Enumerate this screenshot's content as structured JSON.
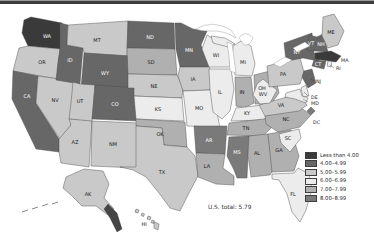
{
  "figure": {
    "us_total": "U.S. total: 5.79"
  },
  "legend": {
    "items": [
      {
        "key": "c1",
        "label": "Less than 4.00",
        "color": "#3a3a3a"
      },
      {
        "key": "c2",
        "label": "4.00–4.99",
        "color": "#676767"
      },
      {
        "key": "c3",
        "label": "5.00–5.99",
        "color": "#c9c9c9"
      },
      {
        "key": "c4",
        "label": "6.00–6.99",
        "color": "#ececec"
      },
      {
        "key": "c5",
        "label": "7.00–7.99",
        "color": "#b0b0b0"
      },
      {
        "key": "c6",
        "label": "8.00–8.99",
        "color": "#7a7a7a"
      }
    ]
  },
  "map": {
    "states": [
      {
        "abbr": "WA",
        "category": "c1"
      },
      {
        "abbr": "OR",
        "category": "c3"
      },
      {
        "abbr": "CA",
        "category": "c2"
      },
      {
        "abbr": "NV",
        "category": "c3"
      },
      {
        "abbr": "ID",
        "category": "c2"
      },
      {
        "abbr": "MT",
        "category": "c3"
      },
      {
        "abbr": "WY",
        "category": "c2"
      },
      {
        "abbr": "UT",
        "category": "c3"
      },
      {
        "abbr": "CO",
        "category": "c2"
      },
      {
        "abbr": "AZ",
        "category": "c3"
      },
      {
        "abbr": "NM",
        "category": "c3"
      },
      {
        "abbr": "ND",
        "category": "c2"
      },
      {
        "abbr": "SD",
        "category": "c5"
      },
      {
        "abbr": "NE",
        "category": "c3"
      },
      {
        "abbr": "KS",
        "category": "c4"
      },
      {
        "abbr": "OK",
        "category": "c5"
      },
      {
        "abbr": "TX",
        "category": "c3"
      },
      {
        "abbr": "MN",
        "category": "c2"
      },
      {
        "abbr": "IA",
        "category": "c3"
      },
      {
        "abbr": "MO",
        "category": "c4"
      },
      {
        "abbr": "AR",
        "category": "c6"
      },
      {
        "abbr": "LA",
        "category": "c5"
      },
      {
        "abbr": "WI",
        "category": "c4"
      },
      {
        "abbr": "IL",
        "category": "c4"
      },
      {
        "abbr": "MI",
        "category": "c4"
      },
      {
        "abbr": "IN",
        "category": "c5"
      },
      {
        "abbr": "OH",
        "category": "c5"
      },
      {
        "abbr": "KY",
        "category": "c4"
      },
      {
        "abbr": "TN",
        "category": "c5"
      },
      {
        "abbr": "MS",
        "category": "c6"
      },
      {
        "abbr": "AL",
        "category": "c5"
      },
      {
        "abbr": "GA",
        "category": "c5"
      },
      {
        "abbr": "FL",
        "category": "c4"
      },
      {
        "abbr": "SC",
        "category": "c4"
      },
      {
        "abbr": "NC",
        "category": "c5"
      },
      {
        "abbr": "VA",
        "category": "c3"
      },
      {
        "abbr": "WV",
        "category": "c4"
      },
      {
        "abbr": "PA",
        "category": "c3"
      },
      {
        "abbr": "NY",
        "category": "c2"
      },
      {
        "abbr": "VT",
        "category": "c2"
      },
      {
        "abbr": "NH",
        "category": "c2"
      },
      {
        "abbr": "ME",
        "category": "c3"
      },
      {
        "abbr": "MA",
        "category": "c1"
      },
      {
        "abbr": "CT",
        "category": "c2"
      },
      {
        "abbr": "RI",
        "category": "c4"
      },
      {
        "abbr": "NJ",
        "category": "c2"
      },
      {
        "abbr": "DE",
        "category": "c4"
      },
      {
        "abbr": "MD",
        "category": "c4"
      },
      {
        "abbr": "DC",
        "category": "c6"
      },
      {
        "abbr": "AK",
        "category": "c3"
      },
      {
        "abbr": "HI",
        "category": "c3"
      }
    ]
  }
}
